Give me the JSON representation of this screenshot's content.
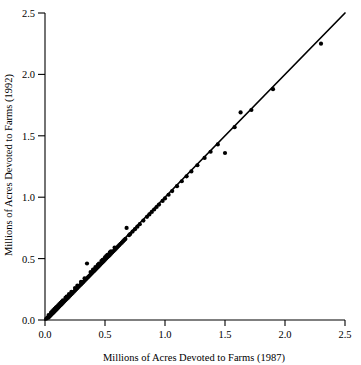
{
  "chart_data": {
    "type": "scatter",
    "title": "",
    "xlabel": "Millions of Acres Devoted to Farms (1987)",
    "ylabel": "Millions of Acres Devoted to Farms (1992)",
    "xlim": [
      0.0,
      2.5
    ],
    "ylim": [
      0.0,
      2.5
    ],
    "xticks": [
      0.0,
      0.5,
      1.0,
      1.5,
      2.0,
      2.5
    ],
    "ytop_ticks": [
      0.0,
      0.5,
      1.0,
      1.5,
      2.0,
      2.5
    ],
    "xtick_labels": [
      "0.0",
      "0.5",
      "1.0",
      "1.5",
      "2.0",
      "2.5"
    ],
    "ytick_labels": [
      "0.0",
      "0.5",
      "1.0",
      "1.5",
      "2.0",
      "2.5"
    ],
    "grid": false,
    "legend": "none",
    "marker": "filled-circle",
    "marker_color": "#000000",
    "marker_size_px": 3.0,
    "annotations": [
      {
        "name": "identity-line",
        "type": "line",
        "x1": 0.0,
        "y1": 0.0,
        "x2": 2.5,
        "y2": 2.5,
        "label": "y = x reference line"
      }
    ],
    "x": [
      0.01,
      0.02,
      0.03,
      0.03,
      0.04,
      0.05,
      0.05,
      0.06,
      0.06,
      0.07,
      0.07,
      0.08,
      0.08,
      0.09,
      0.09,
      0.1,
      0.1,
      0.11,
      0.11,
      0.12,
      0.12,
      0.13,
      0.13,
      0.14,
      0.14,
      0.15,
      0.15,
      0.16,
      0.17,
      0.17,
      0.18,
      0.18,
      0.19,
      0.2,
      0.2,
      0.21,
      0.22,
      0.22,
      0.23,
      0.24,
      0.25,
      0.25,
      0.26,
      0.27,
      0.27,
      0.28,
      0.29,
      0.3,
      0.3,
      0.31,
      0.32,
      0.33,
      0.33,
      0.34,
      0.35,
      0.35,
      0.36,
      0.37,
      0.38,
      0.38,
      0.39,
      0.4,
      0.4,
      0.41,
      0.42,
      0.42,
      0.43,
      0.44,
      0.44,
      0.45,
      0.45,
      0.46,
      0.47,
      0.47,
      0.48,
      0.48,
      0.49,
      0.5,
      0.5,
      0.51,
      0.51,
      0.52,
      0.52,
      0.53,
      0.54,
      0.54,
      0.55,
      0.55,
      0.56,
      0.57,
      0.58,
      0.58,
      0.59,
      0.6,
      0.61,
      0.62,
      0.63,
      0.64,
      0.65,
      0.66,
      0.67,
      0.68,
      0.7,
      0.71,
      0.73,
      0.75,
      0.77,
      0.79,
      0.82,
      0.85,
      0.87,
      0.89,
      0.91,
      0.93,
      0.95,
      0.98,
      1.0,
      1.03,
      1.06,
      1.1,
      1.14,
      1.18,
      1.22,
      1.27,
      1.33,
      1.38,
      1.44,
      1.5,
      1.58,
      1.63,
      1.72,
      1.9,
      2.3
    ],
    "y": [
      0.01,
      0.02,
      0.02,
      0.04,
      0.03,
      0.04,
      0.06,
      0.05,
      0.07,
      0.06,
      0.08,
      0.07,
      0.09,
      0.08,
      0.1,
      0.09,
      0.11,
      0.1,
      0.12,
      0.11,
      0.13,
      0.12,
      0.14,
      0.13,
      0.15,
      0.14,
      0.16,
      0.15,
      0.16,
      0.18,
      0.17,
      0.19,
      0.18,
      0.19,
      0.21,
      0.2,
      0.21,
      0.23,
      0.22,
      0.23,
      0.24,
      0.26,
      0.25,
      0.26,
      0.28,
      0.27,
      0.28,
      0.29,
      0.31,
      0.3,
      0.31,
      0.32,
      0.34,
      0.33,
      0.34,
      0.46,
      0.35,
      0.36,
      0.37,
      0.39,
      0.38,
      0.39,
      0.41,
      0.4,
      0.41,
      0.43,
      0.42,
      0.43,
      0.45,
      0.44,
      0.46,
      0.45,
      0.46,
      0.48,
      0.47,
      0.49,
      0.48,
      0.49,
      0.51,
      0.5,
      0.52,
      0.51,
      0.53,
      0.52,
      0.53,
      0.55,
      0.54,
      0.56,
      0.55,
      0.56,
      0.57,
      0.59,
      0.58,
      0.59,
      0.6,
      0.61,
      0.62,
      0.63,
      0.64,
      0.65,
      0.66,
      0.75,
      0.69,
      0.7,
      0.72,
      0.74,
      0.76,
      0.78,
      0.81,
      0.84,
      0.86,
      0.88,
      0.9,
      0.92,
      0.94,
      0.97,
      0.99,
      1.02,
      1.05,
      1.09,
      1.13,
      1.17,
      1.21,
      1.26,
      1.32,
      1.37,
      1.43,
      1.36,
      1.57,
      1.69,
      1.71,
      1.88,
      2.25
    ]
  }
}
